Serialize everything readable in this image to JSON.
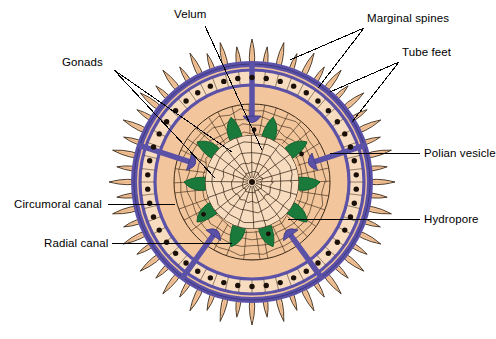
{
  "figure": {
    "background_color": "#FFFFFF",
    "palette": {
      "peach": "#F3C59C",
      "peach_light": "#F7DCC0",
      "peach_dark": "#E0A877",
      "purple": "#5B52A8",
      "purple_dark": "#3E3780",
      "green": "#1A7A3C",
      "green_dark": "#11602E",
      "outline": "#3A2A18",
      "dot": "#1B1008",
      "text": "#000000",
      "leader": "#000000"
    },
    "geometry": {
      "center_x": 252,
      "center_y": 182,
      "body_radius": 118,
      "spine_tip_radius": 143,
      "ring_outer_radius": 112,
      "ring_inner_radius": 97,
      "inner_disc_radius": 78,
      "web_disc_radius": 47,
      "spine_count": 56,
      "canal_dot_count": 46,
      "gonad_count": 10,
      "radial_arm_count": 5
    }
  },
  "labels": [
    {
      "id": "velum",
      "text": "Velum",
      "x": 174,
      "y": 8,
      "anchor": "start",
      "leaders": [
        [
          205,
          26,
          262,
          150
        ]
      ]
    },
    {
      "id": "marginal-spines",
      "text": "Marginal spines",
      "x": 367,
      "y": 12,
      "anchor": "start",
      "leaders": [
        [
          364,
          28,
          290,
          60
        ],
        [
          364,
          28,
          318,
          88
        ]
      ]
    },
    {
      "id": "tube-feet",
      "text": "Tube feet",
      "x": 402,
      "y": 46,
      "anchor": "start",
      "leaders": [
        [
          399,
          62,
          330,
          92
        ],
        [
          399,
          62,
          352,
          122
        ]
      ]
    },
    {
      "id": "gonads",
      "text": "Gonads",
      "x": 62,
      "y": 56,
      "anchor": "start",
      "leaders": [
        [
          114,
          70,
          215,
          178
        ],
        [
          114,
          70,
          232,
          152
        ]
      ]
    },
    {
      "id": "polian-vesicle",
      "text": "Polian vesicle",
      "x": 424,
      "y": 147,
      "anchor": "start",
      "leaders": [
        [
          420,
          153,
          330,
          153
        ]
      ]
    },
    {
      "id": "circumoral-canal",
      "text": "Circumoral canal",
      "x": 14,
      "y": 198,
      "anchor": "start",
      "leaders": [
        [
          108,
          204,
          175,
          204
        ]
      ]
    },
    {
      "id": "hydropore",
      "text": "Hydropore",
      "x": 424,
      "y": 213,
      "anchor": "start",
      "leaders": [
        [
          420,
          219,
          288,
          219
        ]
      ]
    },
    {
      "id": "radial-canal",
      "text": "Radial canal",
      "x": 44,
      "y": 237,
      "anchor": "start",
      "leaders": [
        [
          112,
          243,
          232,
          243
        ]
      ]
    }
  ]
}
